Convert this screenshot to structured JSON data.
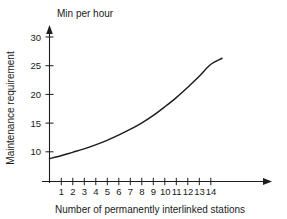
{
  "chart_data": {
    "type": "line",
    "title": "Min per hour",
    "xlabel": "Number of permanently interlinked stations",
    "ylabel": "Maintenance requirement",
    "grid": false,
    "legend": "none",
    "xlim": [
      0,
      15.8
    ],
    "ylim": [
      0,
      31
    ],
    "x_ticks": [
      1,
      2,
      3,
      4,
      5,
      6,
      7,
      8,
      9,
      10,
      11,
      12,
      13,
      14
    ],
    "y_ticks": [
      10,
      15,
      20,
      25,
      30
    ],
    "x_tick_labels": [
      "1",
      "2",
      "3",
      "4",
      "5",
      "6",
      "7",
      "8",
      "9",
      "10",
      "11",
      "12",
      "13",
      "14"
    ],
    "y_tick_labels": [
      "10",
      "15",
      "20",
      "25",
      "30"
    ],
    "axis_arrows": [
      "x-right",
      "y-up"
    ],
    "series": [
      {
        "name": "Maintenance requirement",
        "x": [
          0,
          1,
          2,
          3,
          4,
          5,
          6,
          7,
          8,
          9,
          10,
          11,
          12,
          13,
          14,
          15,
          16
        ],
        "values": [
          8.8,
          9.3,
          9.9,
          10.5,
          11.2,
          12.0,
          12.9,
          13.9,
          15.0,
          16.3,
          17.8,
          19.4,
          21.2,
          23.1,
          25.2,
          26.3,
          26.3
        ],
        "color": "#1c1c1c"
      }
    ]
  },
  "colors": {
    "axis": "#1c1c1c",
    "curve": "#1c1c1c",
    "background": "#ffffff",
    "text": "#1a1a1a"
  }
}
